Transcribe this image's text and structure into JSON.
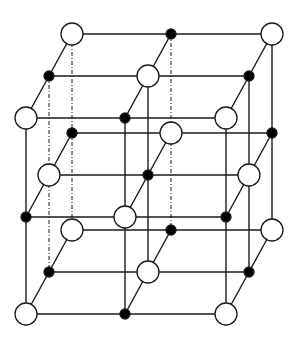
{
  "diagram": {
    "type": "crystal-lattice",
    "colors": {
      "line": "#1a1a1a",
      "open_fill": "#ffffff",
      "filled_fill": "#000000",
      "background": "#ffffff"
    },
    "geometry": {
      "back_x": [
        72,
        171,
        272
      ],
      "back_y": [
        34,
        133,
        230
      ],
      "depth_step": [
        -23,
        42
      ],
      "open_radius": 11,
      "filled_radius": 5
    },
    "node_types": {
      "open": "large-ion",
      "filled": "small-ion"
    },
    "hidden_edges_dashed": [
      {
        "i": 0,
        "k": 0
      },
      {
        "i": 0,
        "k": 1
      },
      {
        "i": 1,
        "k": 0
      }
    ]
  }
}
